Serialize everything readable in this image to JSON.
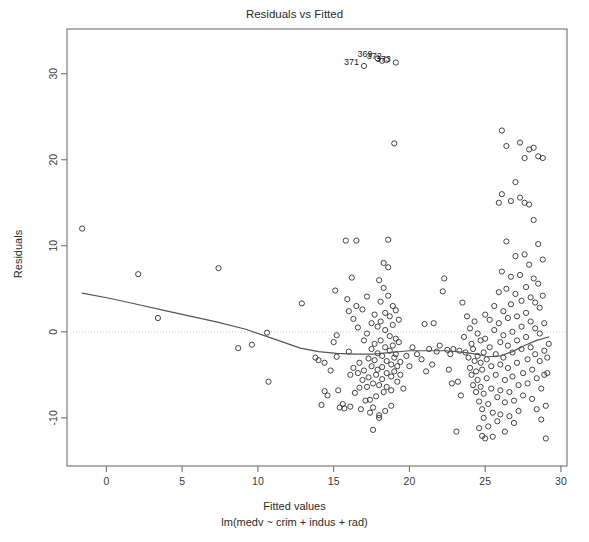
{
  "chart_data": {
    "type": "scatter",
    "title": "Residuals vs Fitted",
    "xlabel": "Fitted values",
    "sublabel": "lm(medv ~ crim + indus + rad)",
    "ylabel": "Residuals",
    "xlim": [
      -2.6,
      30.4
    ],
    "ylim": [
      -15.6,
      35.2
    ],
    "xticks": [
      0,
      5,
      10,
      15,
      20,
      25,
      30
    ],
    "xticklabels": [
      "0",
      "5",
      "10",
      "15",
      "20",
      "25",
      "30"
    ],
    "yticks": [
      -10,
      0,
      10,
      20,
      30
    ],
    "yticklabels": [
      "-10",
      "0",
      "10",
      "20",
      "30"
    ],
    "grid": false,
    "legend": null,
    "zero_reference_line": 0,
    "smoother": "loess",
    "point_style": "open-circle",
    "annotations": [
      {
        "label": "371",
        "x": 17.0,
        "y": 30.9
      },
      {
        "label": "369",
        "x": 17.9,
        "y": 31.8
      },
      {
        "label": "372",
        "x": 18.5,
        "y": 31.6
      },
      {
        "label": "373",
        "x": 19.1,
        "y": 31.3
      }
    ],
    "loess_curve": {
      "x": [
        -1.6,
        0.2,
        2.0,
        3.8,
        5.6,
        7.4,
        9.2,
        11.0,
        12.8,
        14.0,
        15.2,
        16.4,
        17.6,
        18.8,
        20.0,
        21.2,
        22.4,
        23.6,
        24.4,
        25.2,
        26.0,
        26.8,
        27.6,
        28.4,
        29.2
      ],
      "y": [
        4.5,
        3.9,
        3.2,
        2.5,
        1.8,
        1.1,
        0.3,
        -0.8,
        -1.9,
        -2.3,
        -2.5,
        -2.6,
        -2.6,
        -2.4,
        -2.2,
        -2.2,
        -2.2,
        -2.4,
        -2.6,
        -2.9,
        -2.8,
        -2.3,
        -1.6,
        -1.0,
        -0.6
      ]
    },
    "points": [
      [
        -1.6,
        12.0
      ],
      [
        2.1,
        6.7
      ],
      [
        3.4,
        1.6
      ],
      [
        7.4,
        7.4
      ],
      [
        8.7,
        -1.9
      ],
      [
        9.6,
        -1.5
      ],
      [
        10.6,
        -0.1
      ],
      [
        10.7,
        -5.8
      ],
      [
        12.9,
        3.3
      ],
      [
        13.8,
        -3.0
      ],
      [
        14.0,
        -3.3
      ],
      [
        14.2,
        -8.5
      ],
      [
        14.4,
        -3.6
      ],
      [
        14.4,
        -6.9
      ],
      [
        14.6,
        -7.4
      ],
      [
        14.8,
        -4.5
      ],
      [
        15.0,
        -1.2
      ],
      [
        15.1,
        4.8
      ],
      [
        15.2,
        -0.4
      ],
      [
        15.2,
        -2.9
      ],
      [
        15.3,
        -6.8
      ],
      [
        15.4,
        -8.8
      ],
      [
        15.6,
        -8.4
      ],
      [
        15.7,
        -8.9
      ],
      [
        15.8,
        10.6
      ],
      [
        15.9,
        3.8
      ],
      [
        16.0,
        2.4
      ],
      [
        16.0,
        -2.3
      ],
      [
        16.1,
        -5.0
      ],
      [
        16.1,
        -8.7
      ],
      [
        16.2,
        6.3
      ],
      [
        16.3,
        1.5
      ],
      [
        16.3,
        -4.2
      ],
      [
        16.4,
        -7.1
      ],
      [
        16.5,
        10.6
      ],
      [
        16.5,
        3.0
      ],
      [
        16.6,
        0.5
      ],
      [
        16.7,
        -3.6
      ],
      [
        16.7,
        -6.5
      ],
      [
        16.8,
        -9.0
      ],
      [
        16.9,
        2.6
      ],
      [
        17.0,
        -1.0
      ],
      [
        17.0,
        -4.5
      ],
      [
        17.1,
        -8.0
      ],
      [
        17.2,
        4.1
      ],
      [
        17.2,
        -0.2
      ],
      [
        17.3,
        -3.1
      ],
      [
        17.3,
        -5.3
      ],
      [
        17.4,
        -9.4
      ],
      [
        17.5,
        1.0
      ],
      [
        17.5,
        -2.0
      ],
      [
        17.5,
        -4.0
      ],
      [
        17.6,
        -6.0
      ],
      [
        17.6,
        -11.4
      ],
      [
        17.7,
        2.0
      ],
      [
        17.7,
        -1.4
      ],
      [
        17.7,
        -3.3
      ],
      [
        17.8,
        -5.0
      ],
      [
        17.8,
        -7.5
      ],
      [
        17.9,
        0.6
      ],
      [
        17.9,
        -2.5
      ],
      [
        17.9,
        -4.4
      ],
      [
        18.0,
        -6.2
      ],
      [
        18.0,
        -9.7
      ],
      [
        18.0,
        6.0
      ],
      [
        18.1,
        3.5
      ],
      [
        18.1,
        1.2
      ],
      [
        18.1,
        -1.0
      ],
      [
        18.2,
        -2.8
      ],
      [
        18.2,
        -4.1
      ],
      [
        18.2,
        -5.5
      ],
      [
        18.3,
        -7.0
      ],
      [
        18.3,
        8.0
      ],
      [
        18.3,
        5.1
      ],
      [
        18.4,
        2.2
      ],
      [
        18.4,
        0.2
      ],
      [
        18.4,
        -1.8
      ],
      [
        18.5,
        -3.4
      ],
      [
        18.5,
        -4.8
      ],
      [
        18.5,
        -6.4
      ],
      [
        18.6,
        10.7
      ],
      [
        18.6,
        7.5
      ],
      [
        18.6,
        4.2
      ],
      [
        18.7,
        1.8
      ],
      [
        18.7,
        -0.5
      ],
      [
        18.7,
        -2.2
      ],
      [
        18.8,
        -3.8
      ],
      [
        18.8,
        -5.2
      ],
      [
        18.8,
        -6.8
      ],
      [
        18.9,
        3.0
      ],
      [
        18.9,
        0.8
      ],
      [
        18.9,
        -1.6
      ],
      [
        19.0,
        -3.0
      ],
      [
        19.0,
        -4.6
      ],
      [
        19.0,
        21.9
      ],
      [
        19.1,
        2.5
      ],
      [
        19.1,
        -0.8
      ],
      [
        19.1,
        -2.6
      ],
      [
        19.2,
        -4.0
      ],
      [
        19.2,
        -5.8
      ],
      [
        19.3,
        1.4
      ],
      [
        19.3,
        -1.2
      ],
      [
        19.4,
        -3.5
      ],
      [
        19.4,
        -5.0
      ],
      [
        17.2,
        -6.4
      ],
      [
        17.4,
        -7.9
      ],
      [
        17.6,
        -8.8
      ],
      [
        18.0,
        -10.0
      ],
      [
        18.4,
        -9.2
      ],
      [
        18.8,
        -8.6
      ],
      [
        16.6,
        -4.8
      ],
      [
        16.9,
        -5.6
      ],
      [
        21.0,
        0.9
      ],
      [
        21.3,
        -2.0
      ],
      [
        21.6,
        1.0
      ],
      [
        21.8,
        -2.3
      ],
      [
        22.0,
        -1.6
      ],
      [
        22.2,
        4.7
      ],
      [
        22.3,
        6.2
      ],
      [
        22.5,
        -2.1
      ],
      [
        22.7,
        -2.6
      ],
      [
        22.9,
        -2.0
      ],
      [
        23.1,
        -11.6
      ],
      [
        23.3,
        -2.2
      ],
      [
        23.5,
        3.4
      ],
      [
        23.6,
        -0.6
      ],
      [
        23.7,
        -2.4
      ],
      [
        23.8,
        1.8
      ],
      [
        23.9,
        -3.0
      ],
      [
        24.0,
        -4.2
      ],
      [
        24.0,
        0.4
      ],
      [
        24.1,
        -1.4
      ],
      [
        24.1,
        -5.0
      ],
      [
        24.2,
        -2.0
      ],
      [
        24.2,
        -6.2
      ],
      [
        24.3,
        1.2
      ],
      [
        24.3,
        -3.4
      ],
      [
        24.4,
        -4.6
      ],
      [
        24.4,
        -7.0
      ],
      [
        24.5,
        -0.2
      ],
      [
        24.5,
        -2.8
      ],
      [
        24.5,
        -5.6
      ],
      [
        24.6,
        -8.1
      ],
      [
        24.6,
        -11.2
      ],
      [
        24.7,
        -1.0
      ],
      [
        24.7,
        -3.6
      ],
      [
        24.7,
        -6.4
      ],
      [
        24.8,
        -9.0
      ],
      [
        24.8,
        -12.1
      ],
      [
        24.8,
        -4.4
      ],
      [
        24.9,
        -2.4
      ],
      [
        24.9,
        -7.2
      ],
      [
        24.9,
        -10.0
      ],
      [
        25.0,
        -12.4
      ],
      [
        25.0,
        -0.8
      ],
      [
        25.0,
        2.0
      ],
      [
        25.1,
        -3.2
      ],
      [
        25.1,
        -5.4
      ],
      [
        25.2,
        -8.4
      ],
      [
        25.2,
        -11.0
      ],
      [
        25.3,
        1.4
      ],
      [
        25.3,
        -1.8
      ],
      [
        25.4,
        -4.0
      ],
      [
        25.4,
        -6.6
      ],
      [
        25.5,
        -9.4
      ],
      [
        25.5,
        -12.2
      ],
      [
        25.6,
        3.0
      ],
      [
        25.6,
        0.2
      ],
      [
        25.7,
        -2.6
      ],
      [
        25.7,
        -5.0
      ],
      [
        25.8,
        -7.6
      ],
      [
        25.8,
        -10.4
      ],
      [
        25.9,
        15.0
      ],
      [
        25.9,
        4.6
      ],
      [
        25.9,
        1.0
      ],
      [
        26.0,
        -1.2
      ],
      [
        26.0,
        -3.8
      ],
      [
        26.0,
        -6.8
      ],
      [
        26.0,
        -9.6
      ],
      [
        26.1,
        23.4
      ],
      [
        26.1,
        16.0
      ],
      [
        26.1,
        7.0
      ],
      [
        26.2,
        2.4
      ],
      [
        26.2,
        -0.4
      ],
      [
        26.2,
        -3.0
      ],
      [
        26.3,
        -5.6
      ],
      [
        26.3,
        -8.2
      ],
      [
        26.3,
        -11.6
      ],
      [
        26.4,
        21.6
      ],
      [
        26.4,
        10.5
      ],
      [
        26.4,
        5.0
      ],
      [
        26.5,
        1.6
      ],
      [
        26.5,
        -1.6
      ],
      [
        26.5,
        -4.2
      ],
      [
        26.6,
        -7.0
      ],
      [
        26.6,
        -9.8
      ],
      [
        26.7,
        15.2
      ],
      [
        26.7,
        6.4
      ],
      [
        26.7,
        3.2
      ],
      [
        26.8,
        0.0
      ],
      [
        26.8,
        -2.4
      ],
      [
        26.8,
        -5.2
      ],
      [
        26.9,
        -8.0
      ],
      [
        26.9,
        -10.6
      ],
      [
        27.0,
        17.4
      ],
      [
        27.0,
        8.8
      ],
      [
        27.0,
        4.4
      ],
      [
        27.1,
        1.8
      ],
      [
        27.1,
        -1.0
      ],
      [
        27.1,
        -3.6
      ],
      [
        27.2,
        -6.2
      ],
      [
        27.2,
        -9.2
      ],
      [
        27.3,
        22.0
      ],
      [
        27.3,
        15.6
      ],
      [
        27.3,
        6.6
      ],
      [
        27.4,
        3.6
      ],
      [
        27.4,
        0.6
      ],
      [
        27.4,
        -2.0
      ],
      [
        27.5,
        -4.8
      ],
      [
        27.5,
        -7.4
      ],
      [
        27.6,
        20.2
      ],
      [
        27.6,
        15.0
      ],
      [
        27.6,
        9.0
      ],
      [
        27.7,
        5.2
      ],
      [
        27.7,
        2.2
      ],
      [
        27.7,
        -0.6
      ],
      [
        27.8,
        -3.2
      ],
      [
        27.8,
        -6.0
      ],
      [
        27.9,
        21.2
      ],
      [
        27.9,
        14.8
      ],
      [
        27.9,
        7.8
      ],
      [
        28.0,
        4.0
      ],
      [
        28.0,
        1.2
      ],
      [
        28.0,
        -1.8
      ],
      [
        28.1,
        -4.4
      ],
      [
        28.1,
        -7.8
      ],
      [
        28.2,
        21.4
      ],
      [
        28.2,
        13.0
      ],
      [
        28.2,
        6.2
      ],
      [
        28.3,
        3.4
      ],
      [
        28.3,
        0.4
      ],
      [
        28.3,
        -2.6
      ],
      [
        28.4,
        -5.4
      ],
      [
        28.4,
        -9.0
      ],
      [
        28.5,
        20.4
      ],
      [
        28.5,
        10.2
      ],
      [
        28.5,
        5.6
      ],
      [
        28.6,
        2.8
      ],
      [
        28.6,
        -0.2
      ],
      [
        28.6,
        -3.4
      ],
      [
        28.7,
        -6.6
      ],
      [
        28.7,
        -10.2
      ],
      [
        28.8,
        20.2
      ],
      [
        28.8,
        8.4
      ],
      [
        28.8,
        4.2
      ],
      [
        28.9,
        1.0
      ],
      [
        28.9,
        -2.2
      ],
      [
        28.9,
        -5.0
      ],
      [
        29.0,
        -8.6
      ],
      [
        29.0,
        -12.4
      ],
      [
        29.1,
        -3.0
      ],
      [
        29.1,
        -4.8
      ],
      [
        29.2,
        -1.4
      ],
      [
        17.0,
        30.9
      ],
      [
        17.9,
        31.8
      ],
      [
        18.5,
        31.6
      ],
      [
        19.1,
        31.3
      ],
      [
        18.2,
        31.5
      ],
      [
        20.2,
        -1.8
      ],
      [
        20.5,
        -2.6
      ],
      [
        20.8,
        -3.2
      ],
      [
        19.6,
        -6.6
      ],
      [
        19.8,
        -2.8
      ],
      [
        20.0,
        -4.0
      ],
      [
        23.2,
        -5.8
      ],
      [
        23.4,
        -7.4
      ],
      [
        22.6,
        -4.4
      ],
      [
        22.8,
        -6.0
      ],
      [
        21.5,
        -3.8
      ],
      [
        21.1,
        -4.6
      ]
    ]
  }
}
